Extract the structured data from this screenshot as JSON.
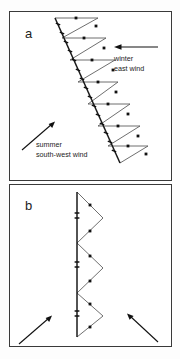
{
  "figure": {
    "title_visible": false,
    "background_color": "#ffffff",
    "stroke_color": "#4a4a4a",
    "spine_color": "#1a1a1a"
  },
  "panels": [
    {
      "id": "a",
      "label": "a",
      "annotations": [
        {
          "name": "winter-east-wind",
          "line1": "winter",
          "line2": "east  wind",
          "arrow_direction": "left"
        },
        {
          "name": "summer-south-west-wind",
          "line1": "summer",
          "line2": "south-west  wind",
          "arrow_direction": "up-right"
        }
      ]
    },
    {
      "id": "b",
      "label": "b",
      "annotations": [
        {
          "name": "arrow-left",
          "arrow_direction": "up-right"
        },
        {
          "name": "arrow-right",
          "arrow_direction": "up-left"
        }
      ]
    }
  ],
  "chart_data": {
    "type": "line",
    "title": "",
    "xlabel": "",
    "ylabel": "",
    "grid": false,
    "legend": "none",
    "series": [
      {
        "name": "panel-a-spine",
        "panel": "a",
        "points": [
          [
            55,
            18
          ],
          [
            120,
            163
          ]
        ]
      },
      {
        "name": "panel-a-sawtooth",
        "panel": "a",
        "points": [
          [
            55,
            18
          ],
          [
            98,
            18
          ],
          [
            62,
            38
          ],
          [
            62,
            38
          ],
          [
            106,
            38
          ],
          [
            70,
            60
          ],
          [
            70,
            60
          ],
          [
            115,
            60
          ],
          [
            78,
            82
          ],
          [
            78,
            82
          ],
          [
            118,
            82
          ],
          [
            88,
            104
          ],
          [
            88,
            104
          ],
          [
            130,
            104
          ],
          [
            98,
            126
          ],
          [
            98,
            126
          ],
          [
            140,
            126
          ],
          [
            108,
            146
          ],
          [
            108,
            146
          ],
          [
            148,
            146
          ],
          [
            120,
            163
          ]
        ]
      },
      {
        "name": "panel-b-spine",
        "panel": "b",
        "points": [
          [
            77,
            192
          ],
          [
            77,
            337
          ]
        ]
      },
      {
        "name": "panel-b-sawtooth",
        "panel": "b",
        "points": [
          [
            77,
            192
          ],
          [
            103,
            218
          ],
          [
            77,
            243
          ],
          [
            77,
            243
          ],
          [
            103,
            268
          ],
          [
            77,
            293
          ],
          [
            77,
            293
          ],
          [
            103,
            316
          ],
          [
            77,
            337
          ]
        ]
      }
    ],
    "markers": {
      "panel_a_dots": [
        [
          76,
          18
        ],
        [
          96,
          26
        ],
        [
          84,
          38
        ],
        [
          104,
          48
        ],
        [
          92,
          60
        ],
        [
          113,
          70
        ],
        [
          98,
          82
        ],
        [
          116,
          92
        ],
        [
          108,
          104
        ],
        [
          128,
          114
        ],
        [
          118,
          126
        ],
        [
          138,
          136
        ],
        [
          128,
          146
        ],
        [
          146,
          154
        ]
      ],
      "panel_b_dots": [
        [
          90,
          205
        ],
        [
          90,
          231
        ],
        [
          90,
          256
        ],
        [
          90,
          281
        ],
        [
          90,
          304
        ],
        [
          90,
          327
        ]
      ],
      "panel_a_spine_ticks": [
        [
          58,
          24
        ],
        [
          62,
          33
        ],
        [
          66,
          42
        ],
        [
          70,
          51
        ],
        [
          74,
          60
        ],
        [
          78,
          70
        ],
        [
          82,
          79
        ],
        [
          86,
          88
        ],
        [
          90,
          97
        ],
        [
          94,
          106
        ],
        [
          98,
          115
        ],
        [
          102,
          124
        ],
        [
          106,
          133
        ],
        [
          110,
          142
        ],
        [
          114,
          151
        ]
      ],
      "panel_b_spine_ticks": [
        [
          77,
          213
        ],
        [
          77,
          218
        ],
        [
          77,
          262
        ],
        [
          77,
          267
        ],
        [
          77,
          311
        ],
        [
          77,
          316
        ]
      ]
    },
    "axis_ranges": {
      "x": [
        0,
        180
      ],
      "y": [
        0,
        359
      ]
    }
  }
}
